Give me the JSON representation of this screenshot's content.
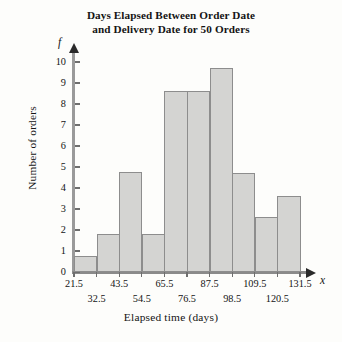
{
  "chart_data": {
    "type": "bar",
    "title": "Days Elapsed Between Order Date and Delivery Date for 50 Orders",
    "title_line1": "Days Elapsed Between Order Date",
    "title_line2": "and Delivery Date for 50 Orders",
    "xlabel": "Elapsed time (days)",
    "ylabel": "Number of orders",
    "x_axis_variable": "x",
    "y_axis_variable": "f",
    "grid": false,
    "legend": false,
    "ylim": [
      0,
      10
    ],
    "xlim": [
      21.5,
      131.5
    ],
    "bin_width": 11,
    "bin_edges": [
      21.5,
      32.5,
      43.5,
      54.5,
      65.5,
      76.5,
      87.5,
      98.5,
      109.5,
      120.5,
      131.5
    ],
    "edge_labels": [
      "21.5",
      "32.5",
      "43.5",
      "54.5",
      "65.5",
      "76.5",
      "87.5",
      "98.5",
      "109.5",
      "120.5",
      "131.5"
    ],
    "categories": [
      "21.5-32.5",
      "32.5-43.5",
      "43.5-54.5",
      "54.5-65.5",
      "65.5-76.5",
      "76.5-87.5",
      "87.5-98.5",
      "98.5-109.5",
      "109.5-120.5",
      "120.5-131.5"
    ],
    "values": [
      0.75,
      1.8,
      4.75,
      1.8,
      8.6,
      8.6,
      9.7,
      4.7,
      2.6,
      3.6
    ],
    "y_tick_labels": [
      "0",
      "1",
      "2",
      "3",
      "4",
      "5",
      "6",
      "7",
      "8",
      "9",
      "10"
    ],
    "y_ticks": [
      0,
      1,
      2,
      3,
      4,
      5,
      6,
      7,
      8,
      9,
      10
    ],
    "bar_fill_color": "#d4d4d2",
    "bar_border_color": "#8d8d8d",
    "axis_color": "#8c8c8c",
    "text_color": "#141414",
    "background_color": "#fdfdfb"
  }
}
